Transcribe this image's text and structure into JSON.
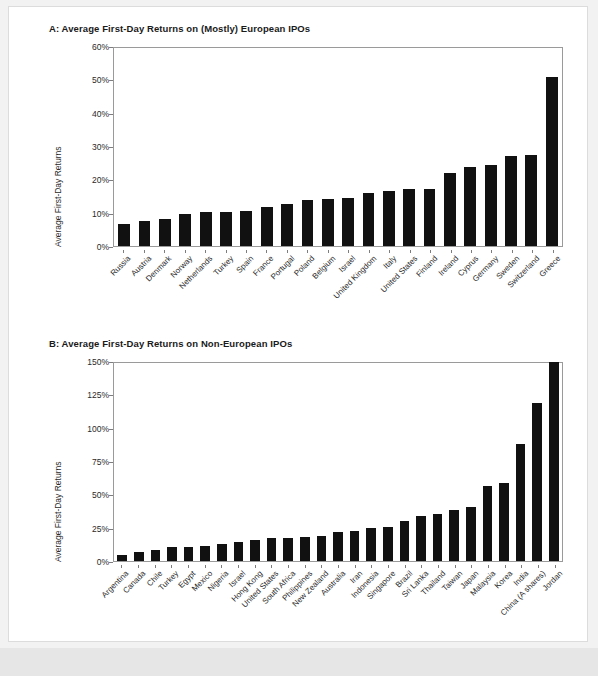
{
  "page": {
    "background": "#f2f2f2",
    "sheet_background": "#ffffff",
    "bar_color": "#111111",
    "axis_color": "#7d7d7d"
  },
  "chart_data": [
    {
      "type": "bar",
      "panel": "A",
      "title": "A: Average First-Day Returns on (Mostly) European IPOs",
      "xlabel": "",
      "ylabel": "Average First-Day Returns",
      "ylim": [
        0,
        60
      ],
      "yticks": [
        0,
        10,
        20,
        30,
        40,
        50,
        60
      ],
      "ytick_labels": [
        "0%",
        "10%",
        "20%",
        "30%",
        "40%",
        "50%",
        "60%"
      ],
      "grid": false,
      "legend": "none",
      "categories": [
        "Russia",
        "Austria",
        "Denmark",
        "Norway",
        "Netherlands",
        "Turkey",
        "Spain",
        "France",
        "Portugal",
        "Poland",
        "Belgium",
        "Israel",
        "United Kingdom",
        "Italy",
        "United States",
        "Finland",
        "Ireland",
        "Cyprus",
        "Germany",
        "Sweden",
        "Switzerland",
        "Greece"
      ],
      "values": [
        6.7,
        7.6,
        8.1,
        9.6,
        10.2,
        10.3,
        10.4,
        11.6,
        12.6,
        13.9,
        14.2,
        14.4,
        16.0,
        16.6,
        17.2,
        17.2,
        21.9,
        23.6,
        24.2,
        27.0,
        27.3,
        50.8
      ]
    },
    {
      "type": "bar",
      "panel": "B",
      "title": "B: Average First-Day Returns on Non-European IPOs",
      "xlabel": "",
      "ylabel": "Average First-Day Returns",
      "ylim": [
        0,
        150
      ],
      "yticks": [
        0,
        25,
        50,
        75,
        100,
        125,
        150
      ],
      "ytick_labels": [
        "0%",
        "25%",
        "50%",
        "75%",
        "100%",
        "125%",
        "150%"
      ],
      "grid": false,
      "legend": "none",
      "categories": [
        "Argentina",
        "Canada",
        "Chile",
        "Turkey",
        "Egypt",
        "Mexico",
        "Nigeria",
        "Israel",
        "Hong Kong",
        "United States",
        "South Africa",
        "Philippines",
        "New Zealand",
        "Australia",
        "Iran",
        "Indonesia",
        "Singapore",
        "Brazil",
        "Sri Lanka",
        "Thailand",
        "Taiwan",
        "Japan",
        "Malaysia",
        "Korea",
        "India",
        "China (A shares)",
        "Jordan"
      ],
      "values": [
        4.4,
        6.5,
        8.4,
        10.3,
        10.4,
        11.6,
        13.1,
        14.4,
        15.8,
        16.9,
        17.4,
        18.1,
        18.6,
        21.8,
        22.4,
        24.9,
        25.8,
        30.2,
        33.5,
        35.1,
        38.1,
        40.2,
        56.2,
        58.8,
        88.0,
        118.4,
        149.0
      ]
    }
  ]
}
